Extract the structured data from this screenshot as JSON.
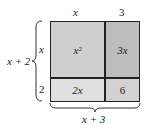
{
  "diagram": {
    "top_labels": {
      "left": "x",
      "right": "3"
    },
    "side_labels": {
      "top": "x",
      "bottom": "2"
    },
    "left_brace_label": "x + 2",
    "bottom_brace_label": "x + 3",
    "cells": [
      {
        "id": "top-left",
        "text": "x²",
        "color": "#cfcfcf"
      },
      {
        "id": "top-right",
        "text": "3x",
        "color": "#bdbdbd"
      },
      {
        "id": "bottom-left",
        "text": "2x",
        "color": "#e0e0e0"
      },
      {
        "id": "bottom-right",
        "text": "6",
        "color": "#d2d2d2"
      }
    ]
  }
}
